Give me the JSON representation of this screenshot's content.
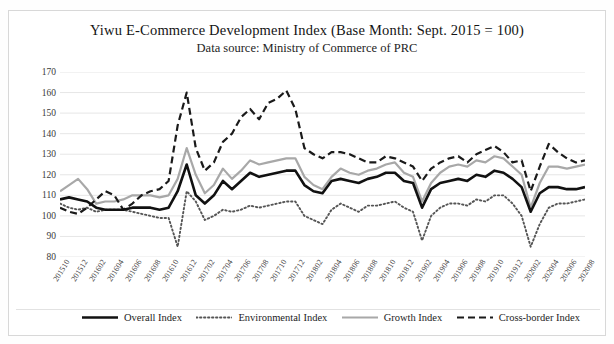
{
  "chart_data": {
    "type": "line",
    "title": "Yiwu E-Commerce  Development Index (Base Month: Sept. 2015 = 100)",
    "subtitle": "Data source: Ministry of Commerce of PRC",
    "xlabel": "",
    "ylabel": "",
    "ylim": [
      80,
      170
    ],
    "yticks": [
      80,
      90,
      100,
      110,
      120,
      130,
      140,
      150,
      160,
      170
    ],
    "grid": true,
    "legend_position": "bottom",
    "x": [
      "201510",
      "201511",
      "201512",
      "201601",
      "201602",
      "201603",
      "201604",
      "201605",
      "201606",
      "201607",
      "201608",
      "201609",
      "201610",
      "201611",
      "201612",
      "201701",
      "201702",
      "201703",
      "201704",
      "201705",
      "201706",
      "201707",
      "201708",
      "201709",
      "201710",
      "201711",
      "201712",
      "201801",
      "201802",
      "201803",
      "201804",
      "201805",
      "201806",
      "201807",
      "201808",
      "201809",
      "201810",
      "201811",
      "201812",
      "201901",
      "201902",
      "201903",
      "201904",
      "201905",
      "201906",
      "201907",
      "201908",
      "201909",
      "201910",
      "201911",
      "201912",
      "202001",
      "202002",
      "202003",
      "202004",
      "202005",
      "202006",
      "202007",
      "202008"
    ],
    "xtick_labels": [
      "201510",
      "201512",
      "201602",
      "201604",
      "201606",
      "201608",
      "201610",
      "201612",
      "201702",
      "201704",
      "201706",
      "201708",
      "201710",
      "201712",
      "201802",
      "201804",
      "201806",
      "201808",
      "201810",
      "201812",
      "201902",
      "201904",
      "201906",
      "201908",
      "201910",
      "201912",
      "202002",
      "202004",
      "202006",
      "202008"
    ],
    "xtick_every": 2,
    "series": [
      {
        "name": "Overall Index",
        "style": "solid-thick",
        "color": "#111111",
        "width": 2.6,
        "values": [
          108,
          109,
          108,
          107,
          104,
          103,
          103,
          103,
          104,
          104,
          104,
          103,
          104,
          112,
          125,
          110,
          106,
          110,
          117,
          113,
          117,
          121,
          119,
          120,
          121,
          122,
          122,
          115,
          112,
          111,
          117,
          118,
          117,
          116,
          118,
          119,
          121,
          121,
          117,
          116,
          104,
          113,
          116,
          117,
          118,
          117,
          120,
          119,
          122,
          121,
          118,
          114,
          102,
          111,
          114,
          114,
          113,
          113,
          114
        ]
      },
      {
        "name": "Environmental Index",
        "style": "dotted",
        "color": "#555555",
        "width": 1.9,
        "values": [
          106,
          104,
          103,
          104,
          102,
          103,
          103,
          103,
          102,
          101,
          100,
          99,
          99,
          85,
          112,
          107,
          98,
          100,
          103,
          102,
          103,
          105,
          104,
          105,
          106,
          107,
          107,
          100,
          98,
          96,
          103,
          106,
          104,
          102,
          105,
          105,
          106,
          107,
          104,
          102,
          88,
          100,
          104,
          106,
          106,
          105,
          108,
          107,
          110,
          110,
          106,
          100,
          85,
          96,
          104,
          106,
          106,
          107,
          108
        ]
      },
      {
        "name": "Growth Index",
        "style": "solid-thin",
        "color": "#a8a8a8",
        "width": 2.2,
        "values": [
          112,
          115,
          118,
          113,
          106,
          107,
          107,
          108,
          110,
          110,
          110,
          109,
          110,
          118,
          133,
          120,
          111,
          115,
          123,
          118,
          122,
          127,
          125,
          126,
          127,
          128,
          128,
          119,
          115,
          113,
          119,
          123,
          121,
          120,
          122,
          123,
          125,
          126,
          121,
          119,
          107,
          116,
          121,
          124,
          125,
          124,
          127,
          126,
          129,
          128,
          124,
          120,
          104,
          116,
          124,
          124,
          123,
          124,
          125
        ]
      },
      {
        "name": "Cross-border Index",
        "style": "dashed",
        "color": "#1a1a1a",
        "width": 2.2,
        "values": [
          104,
          102,
          101,
          104,
          108,
          112,
          110,
          103,
          106,
          110,
          112,
          113,
          117,
          144,
          160,
          133,
          122,
          126,
          136,
          140,
          148,
          152,
          147,
          155,
          157,
          161,
          152,
          133,
          130,
          128,
          131,
          131,
          130,
          128,
          126,
          126,
          129,
          128,
          126,
          124,
          117,
          123,
          126,
          128,
          129,
          126,
          130,
          132,
          134,
          131,
          126,
          127,
          112,
          124,
          135,
          131,
          128,
          126,
          127
        ]
      }
    ]
  },
  "legend": {
    "items": [
      {
        "label": "Overall Index",
        "style": "solid-thick"
      },
      {
        "label": "Environmental Index",
        "style": "dotted"
      },
      {
        "label": "Growth Index",
        "style": "solid-thin"
      },
      {
        "label": "Cross-border Index",
        "style": "dashed"
      }
    ]
  }
}
